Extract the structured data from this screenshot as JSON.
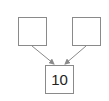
{
  "diagram": {
    "type": "number-bond",
    "top_left_box": {
      "value": ""
    },
    "top_right_box": {
      "value": ""
    },
    "bottom_box": {
      "value": "10"
    },
    "colors": {
      "border": "#8a8a8a",
      "arrow": "#8a8a8a",
      "text": "#222222"
    }
  }
}
